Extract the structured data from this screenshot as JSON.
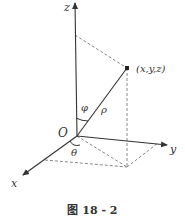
{
  "diagram": {
    "type": "spherical-coordinates",
    "axes": {
      "x": "x",
      "y": "y",
      "z": "z"
    },
    "origin_label": "O",
    "point_label": "(x,y,z)",
    "angle_phi": "φ",
    "angle_theta": "θ",
    "radius_label": "ρ",
    "caption": "图 18 - 2"
  },
  "colors": {
    "line": "#333333",
    "dashed": "#888888"
  }
}
